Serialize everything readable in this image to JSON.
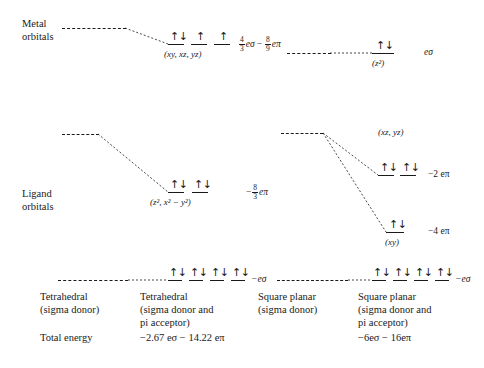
{
  "figure": {
    "axis_labels": {
      "metal_orbitals": "Metal orbitals",
      "metal_orbitals_line1": "Metal",
      "metal_orbitals_line2": "orbitals",
      "ligand_orbitals_line1": "Ligand",
      "ligand_orbitals_line2": "orbitals",
      "total_energy": "Total energy"
    },
    "tetrahedral": {
      "column_sigma_line1": "Tetrahedral",
      "column_sigma_line2": "(sigma donor)",
      "column_pi_line1": "Tetrahedral",
      "column_pi_line2": "(sigma donor and",
      "column_pi_line3": "pi acceptor)",
      "total_energy_value": "−2.67 eσ − 14.22 eπ",
      "levels": [
        {
          "name": "t2-metal",
          "orbitals": "(xy, xz, yz)",
          "energy": "4/3 eσ − 8/9 eπ",
          "energy_num1": "4",
          "energy_den1": "3",
          "energy_sym1": "eσ",
          "energy_op": "−",
          "energy_num2": "8",
          "energy_den2": "9",
          "energy_sym2": "eπ",
          "electrons": [
            "pair",
            "up",
            "up"
          ]
        },
        {
          "name": "e-ligand",
          "orbitals": "(z², x² − y²)",
          "energy": "− 8/3 eπ",
          "energy_sign": "−",
          "energy_num": "8",
          "energy_den": "3",
          "energy_sym": "eπ",
          "electrons": [
            "pair",
            "pair"
          ]
        },
        {
          "name": "bonding-sigma",
          "energy": "−eσ",
          "electrons": [
            "pair",
            "pair",
            "pair",
            "pair"
          ]
        }
      ]
    },
    "square_planar": {
      "column_sigma_line1": "Square planar",
      "column_sigma_line2": "(sigma donor)",
      "column_pi_line1": "Square planar",
      "column_pi_line2": "(sigma donor and",
      "column_pi_line3": "pi acceptor)",
      "total_energy_value": "−6eσ − 16eπ",
      "levels": [
        {
          "name": "z2-metal",
          "orbitals": "(z²)",
          "energy": "eσ",
          "electrons": [
            "pair"
          ]
        },
        {
          "name": "xz-yz",
          "orbitals": "(xz, yz)",
          "energy": "−2 eπ",
          "electrons": [
            "pair",
            "pair"
          ]
        },
        {
          "name": "xy",
          "orbitals": "(xy)",
          "energy": "−4 eπ",
          "electrons": [
            "pair"
          ]
        },
        {
          "name": "bonding-sigma",
          "energy": "−eσ",
          "electrons": [
            "pair",
            "pair",
            "pair",
            "pair"
          ]
        }
      ]
    },
    "glyphs": {
      "pair": "↑↓",
      "up": "↑"
    },
    "colors": {
      "ink": "#1a1a1a",
      "background": "#ffffff"
    }
  }
}
